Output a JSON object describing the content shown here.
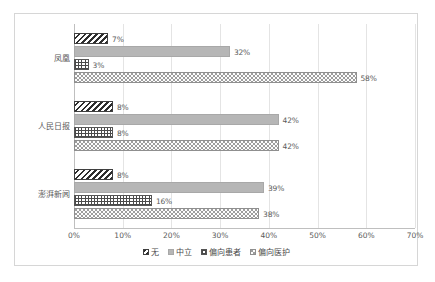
{
  "chart_data": {
    "type": "bar",
    "orientation": "horizontal",
    "title": "",
    "xlabel": "",
    "ylabel": "",
    "xlim": [
      0,
      70
    ],
    "grid": true,
    "legend_position": "bottom",
    "categories": [
      "凤凰",
      "人民日报",
      "澎湃新闻"
    ],
    "xticks": [
      "0%",
      "10%",
      "20%",
      "30%",
      "40%",
      "50%",
      "60%",
      "70%"
    ],
    "xtick_values": [
      0,
      10,
      20,
      30,
      40,
      50,
      60,
      70
    ],
    "series": [
      {
        "name": "无",
        "pattern": "diagonal-hatch",
        "values": [
          7,
          8,
          8
        ],
        "labels": [
          "7%",
          "8%",
          "8%"
        ]
      },
      {
        "name": "中立",
        "pattern": "solid-gray",
        "values": [
          32,
          42,
          39
        ],
        "labels": [
          "32%",
          "42%",
          "39%"
        ]
      },
      {
        "name": "偏向患者",
        "pattern": "cross-grid",
        "values": [
          3,
          8,
          16
        ],
        "labels": [
          "3%",
          "8%",
          "16%"
        ]
      },
      {
        "name": "偏向医护",
        "pattern": "dotted",
        "values": [
          58,
          42,
          38
        ],
        "labels": [
          "58%",
          "42%",
          "38%"
        ]
      }
    ]
  },
  "colors": {
    "frame_border": "#d6d6d6",
    "gridline": "#e4e4e4",
    "axis": "#bfbfbf",
    "text": "#5a5a5a",
    "series_solid": "#b6b6b6"
  }
}
